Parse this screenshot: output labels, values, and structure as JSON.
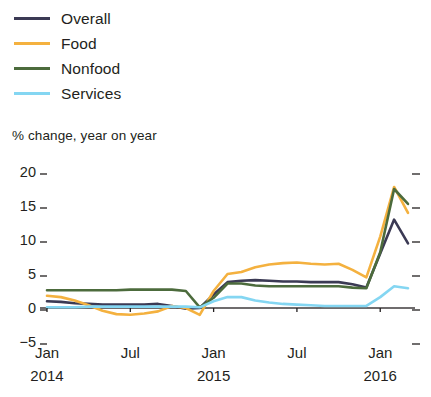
{
  "legend": {
    "items": [
      {
        "label": "Overall",
        "color": "#3b3a54",
        "name": "legend-item-overall"
      },
      {
        "label": "Food",
        "color": "#f4b13f",
        "name": "legend-item-food"
      },
      {
        "label": "Nonfood",
        "color": "#4c6b3c",
        "name": "legend-item-nonfood"
      },
      {
        "label": "Services",
        "color": "#84d6f2",
        "name": "legend-item-services"
      }
    ]
  },
  "subtitle": "% change, year on year",
  "chart_data": {
    "type": "line",
    "title": "",
    "subtitle": "% change, year on year",
    "xlabel": "",
    "ylabel": "% change, year on year",
    "ylim": [
      -5,
      20
    ],
    "ytick_values": [
      20,
      15,
      10,
      5,
      0,
      -5
    ],
    "ytick_labels": [
      "20",
      "15",
      "10",
      "5",
      "0",
      "−5"
    ],
    "grid": false,
    "legend_position": "top-left",
    "zero_line": true,
    "x": [
      "2014-01",
      "2014-02",
      "2014-03",
      "2014-04",
      "2014-05",
      "2014-06",
      "2014-07",
      "2014-08",
      "2014-09",
      "2014-10",
      "2014-11",
      "2014-12",
      "2015-01",
      "2015-02",
      "2015-03",
      "2015-04",
      "2015-05",
      "2015-06",
      "2015-07",
      "2015-08",
      "2015-09",
      "2015-10",
      "2015-11",
      "2015-12",
      "2016-01",
      "2016-02",
      "2016-03"
    ],
    "xtick_positions": [
      "2014-01",
      "2014-07",
      "2015-01",
      "2015-07",
      "2016-01"
    ],
    "xtick_labels": [
      "Jan",
      "Jul",
      "Jan",
      "Jul",
      "Jan"
    ],
    "xtick_years": [
      "2014",
      "",
      "2015",
      "",
      "2016"
    ],
    "series": [
      {
        "name": "Overall",
        "color": "#3b3a54",
        "values": [
          1.0,
          0.9,
          0.7,
          0.6,
          0.5,
          0.5,
          0.5,
          0.5,
          0.6,
          0.3,
          -0.1,
          0.0,
          2.0,
          3.8,
          4.0,
          4.1,
          4.0,
          3.9,
          3.9,
          3.8,
          3.8,
          3.8,
          3.5,
          3.0,
          8.0,
          13.0,
          9.5
        ]
      },
      {
        "name": "Food",
        "color": "#f4b13f",
        "values": [
          1.8,
          1.6,
          1.1,
          0.4,
          -0.4,
          -0.9,
          -1.0,
          -0.8,
          -0.5,
          0.3,
          0.0,
          -1.0,
          2.5,
          5.0,
          5.3,
          6.0,
          6.4,
          6.6,
          6.7,
          6.5,
          6.4,
          6.5,
          5.6,
          4.5,
          10.5,
          17.8,
          14.0
        ]
      },
      {
        "name": "Nonfood",
        "color": "#4c6b3c",
        "values": [
          2.6,
          2.6,
          2.6,
          2.6,
          2.6,
          2.6,
          2.7,
          2.7,
          2.7,
          2.7,
          2.5,
          0.1,
          1.5,
          3.6,
          3.6,
          3.3,
          3.2,
          3.2,
          3.2,
          3.2,
          3.2,
          3.2,
          3.0,
          2.9,
          8.2,
          17.5,
          15.3
        ]
      },
      {
        "name": "Services",
        "color": "#84d6f2",
        "values": [
          0.1,
          0.1,
          0.1,
          0.2,
          0.2,
          0.2,
          0.2,
          0.2,
          0.2,
          0.2,
          0.2,
          0.1,
          1.0,
          1.6,
          1.6,
          1.1,
          0.8,
          0.6,
          0.5,
          0.4,
          0.3,
          0.3,
          0.3,
          0.3,
          1.6,
          3.2,
          2.9
        ]
      }
    ]
  }
}
